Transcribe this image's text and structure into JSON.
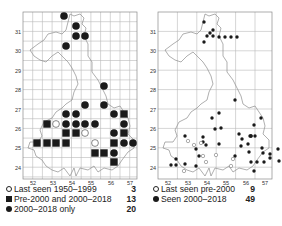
{
  "left_map": {
    "y_labels": [
      "31",
      "30",
      "29",
      "28",
      "27",
      "26",
      "25",
      "24"
    ],
    "x_labels": [
      "52",
      "53",
      "54",
      "55",
      "56",
      "57"
    ],
    "legend": [
      {
        "symbol": "open-circle",
        "label": "Last seen 1950–1999",
        "count": "3"
      },
      {
        "symbol": "filled-square",
        "label": "Pre-2000 and 2000–2018",
        "count": "13"
      },
      {
        "symbol": "filled-circle",
        "label": "2000–2018 only",
        "count": "20"
      }
    ],
    "markers": {
      "filled_circle": [
        [
          64,
          16
        ],
        [
          76,
          26
        ],
        [
          76,
          36
        ],
        [
          85,
          36
        ],
        [
          66,
          46
        ],
        [
          104,
          86
        ],
        [
          85,
          105
        ],
        [
          104,
          105
        ],
        [
          66,
          114
        ],
        [
          76,
          114
        ],
        [
          114,
          114
        ],
        [
          66,
          124
        ],
        [
          76,
          124
        ],
        [
          85,
          124
        ],
        [
          95,
          124
        ],
        [
          124,
          124
        ],
        [
          114,
          133
        ],
        [
          124,
          143
        ],
        [
          133,
          143
        ],
        [
          114,
          153
        ]
      ],
      "filled_square": [
        [
          124,
          114
        ],
        [
          47,
          124
        ],
        [
          66,
          133
        ],
        [
          76,
          133
        ],
        [
          124,
          133
        ],
        [
          37,
          143
        ],
        [
          47,
          143
        ],
        [
          56,
          143
        ],
        [
          66,
          143
        ],
        [
          114,
          143
        ],
        [
          95,
          153
        ],
        [
          104,
          153
        ],
        [
          114,
          162
        ]
      ],
      "open_circle": [
        [
          56,
          124
        ],
        [
          85,
          133
        ],
        [
          95,
          143
        ]
      ]
    }
  },
  "right_map": {
    "y_labels": [
      "31",
      "30",
      "29",
      "28",
      "27",
      "26",
      "25",
      "24"
    ],
    "x_labels": [
      "52",
      "53",
      "54",
      "55",
      "56",
      "57"
    ],
    "legend": [
      {
        "symbol": "open-circle",
        "label": "Last seen pre-2000",
        "count": "9"
      },
      {
        "symbol": "filled-circle",
        "label": "Seen 2000–2018",
        "count": "49"
      }
    ],
    "markers": {
      "filled_circle": [
        [
          204,
          22
        ],
        [
          210,
          33
        ],
        [
          213,
          30
        ],
        [
          207,
          36
        ],
        [
          213,
          36
        ],
        [
          219,
          37
        ],
        [
          225,
          37
        ],
        [
          231,
          37
        ],
        [
          237,
          37
        ],
        [
          204,
          42
        ],
        [
          235,
          100
        ],
        [
          219,
          113
        ],
        [
          212,
          118
        ],
        [
          261,
          118
        ],
        [
          254,
          125
        ],
        [
          250,
          136
        ],
        [
          221,
          128
        ],
        [
          251,
          136
        ],
        [
          215,
          129
        ],
        [
          251,
          136
        ],
        [
          242,
          139
        ],
        [
          262,
          148
        ],
        [
          270,
          154
        ],
        [
          278,
          149
        ],
        [
          249,
          152
        ],
        [
          185,
          136
        ],
        [
          196,
          149
        ],
        [
          203,
          137
        ],
        [
          206,
          145
        ],
        [
          219,
          144
        ],
        [
          235,
          156
        ],
        [
          251,
          162
        ],
        [
          257,
          162
        ],
        [
          264,
          162
        ],
        [
          270,
          158
        ],
        [
          254,
          171
        ],
        [
          263,
          153
        ],
        [
          279,
          161
        ],
        [
          203,
          142
        ],
        [
          255,
          136
        ],
        [
          239,
          134
        ],
        [
          241,
          146
        ],
        [
          248,
          144
        ],
        [
          176,
          159
        ],
        [
          171,
          165
        ],
        [
          176,
          165
        ],
        [
          185,
          164
        ],
        [
          196,
          166
        ],
        [
          199,
          156
        ]
      ],
      "open_circle": [
        [
          188,
          141
        ],
        [
          194,
          145
        ],
        [
          201,
          143
        ],
        [
          203,
          156
        ],
        [
          216,
          155
        ],
        [
          206,
          162
        ],
        [
          233,
          159
        ],
        [
          231,
          166
        ],
        [
          184,
          171
        ]
      ]
    }
  },
  "colors": {
    "grid": "#b9b9b9",
    "border": "#8a8a8a",
    "outline": "#8c8c8c",
    "marker": "#1a1a1a",
    "text": "#222222"
  }
}
